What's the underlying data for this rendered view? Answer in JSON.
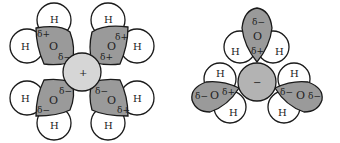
{
  "figure": {
    "cation_hydration": {
      "ion_label": "+",
      "waters": [
        {
          "position": "top-left",
          "H1": "H",
          "H2": "H",
          "O": "O",
          "charge_near_H": "δ+",
          "charge_near_ion": "δ−"
        },
        {
          "position": "top-right",
          "H1": "H",
          "H2": "H",
          "O": "O",
          "charge_near_H": "δ+",
          "charge_near_ion": "δ+"
        },
        {
          "position": "bottom-left",
          "H1": "H",
          "H2": "H",
          "O": "O",
          "charge_near_ion": "δ−",
          "charge_outer": "δ−"
        },
        {
          "position": "bottom-right",
          "H1": "H",
          "H2": "H",
          "O": "O",
          "charge_near_ion": "δ−",
          "charge_outer": "δ+"
        }
      ]
    },
    "anion_hydration": {
      "ion_label": "−",
      "waters": [
        {
          "position": "top",
          "H1": "H",
          "H2": "H",
          "O": "O",
          "charge_outer": "δ−",
          "charge_near_ion": "δ+"
        },
        {
          "position": "left",
          "H1": "H",
          "H2": "H",
          "O": "O",
          "charge_outer": "δ−",
          "charge_near_ion": "δ+"
        },
        {
          "position": "right",
          "H1": "H",
          "H2": "H",
          "O": "O",
          "charge_near_ion": "δ−",
          "charge_outer": "δ−"
        }
      ]
    }
  },
  "colors": {
    "cation_fill": "#d6d6d6",
    "anion_fill": "#b3b3b3",
    "oxygen_fill": "#9a9a9a",
    "hydrogen_fill": "#ffffff",
    "stroke": "#1a1a1a"
  }
}
